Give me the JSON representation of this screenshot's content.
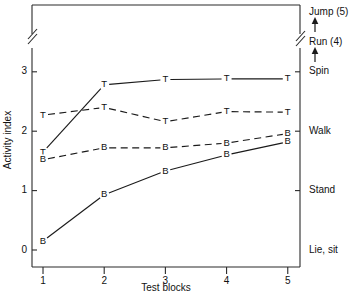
{
  "chart_data": {
    "type": "line",
    "title": "",
    "xlabel": "Test blocks",
    "ylabel": "Activity index",
    "x": [
      1,
      2,
      3,
      4,
      5
    ],
    "xtick_labels": [
      "1",
      "2",
      "3",
      "4",
      "5"
    ],
    "ytick_labels": [
      "0",
      "1",
      "2",
      "3"
    ],
    "ytick_values": [
      0,
      1,
      2,
      3
    ],
    "ylim": [
      0,
      3.55
    ],
    "xlim": [
      0.82,
      5.2
    ],
    "grid": false,
    "legend_position": "none",
    "axis_break": {
      "present": true,
      "note": "y-axis break above 3",
      "value": 3.3
    },
    "series": [
      {
        "name": "T-solid",
        "marker": "T",
        "line_style": "solid",
        "values": [
          1.65,
          2.78,
          2.87,
          2.88,
          2.88
        ]
      },
      {
        "name": "T-dashed",
        "marker": "T",
        "line_style": "dashed",
        "values": [
          2.27,
          2.4,
          2.16,
          2.33,
          2.32
        ]
      },
      {
        "name": "B-dashed",
        "marker": "B",
        "line_style": "dashed",
        "values": [
          1.52,
          1.72,
          1.72,
          1.8,
          1.96
        ]
      },
      {
        "name": "B-solid",
        "marker": "B",
        "line_style": "solid",
        "values": [
          0.15,
          0.93,
          1.33,
          1.6,
          1.82
        ]
      }
    ],
    "right_axis_labels": [
      {
        "text": "Jump (5)",
        "value": 5,
        "has_tick": false
      },
      {
        "text": "Run  (4)",
        "value": 4,
        "has_tick": false
      },
      {
        "text": "Spin",
        "value": 3,
        "has_tick": true
      },
      {
        "text": "Walk",
        "value": 2,
        "has_tick": true
      },
      {
        "text": "Stand",
        "value": 1,
        "has_tick": true
      },
      {
        "text": "Lie, sit",
        "value": 0,
        "has_tick": false
      }
    ],
    "right_axis_arrows": 2
  }
}
